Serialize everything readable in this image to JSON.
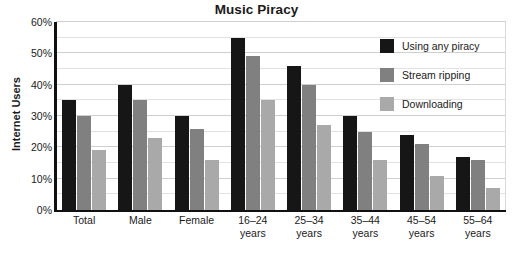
{
  "chart_data": {
    "type": "bar",
    "title": "Music Piracy",
    "xlabel": "",
    "ylabel": "Internet Users",
    "ylim": [
      0,
      60
    ],
    "ytick_labels": [
      "0%",
      "10%",
      "20%",
      "30%",
      "40%",
      "50%",
      "60%"
    ],
    "ytick_values": [
      0,
      10,
      20,
      30,
      40,
      50,
      60
    ],
    "grid": true,
    "grid_minor_step": 5,
    "legend_position": "top-right inside plot area",
    "categories": [
      "Total",
      "Male",
      "Female",
      "16–24 years",
      "25–34 years",
      "35–44 years",
      "45–54 years",
      "55–64 years"
    ],
    "category_lines": [
      [
        "Total",
        ""
      ],
      [
        "Male",
        ""
      ],
      [
        "Female",
        ""
      ],
      [
        "16–24",
        "years"
      ],
      [
        "25–34",
        "years"
      ],
      [
        "35–44",
        "years"
      ],
      [
        "45–54",
        "years"
      ],
      [
        "55–64",
        "years"
      ]
    ],
    "series": [
      {
        "name": "Using any piracy",
        "color": "#161616",
        "values": [
          35,
          40,
          30,
          55,
          46,
          30,
          24,
          17
        ]
      },
      {
        "name": "Stream ripping",
        "color": "#808080",
        "values": [
          30,
          35,
          26,
          49,
          40,
          25,
          21,
          16
        ]
      },
      {
        "name": "Downloading",
        "color": "#a9a9a9",
        "values": [
          19,
          23,
          16,
          35,
          27,
          16,
          11,
          7
        ]
      }
    ]
  }
}
